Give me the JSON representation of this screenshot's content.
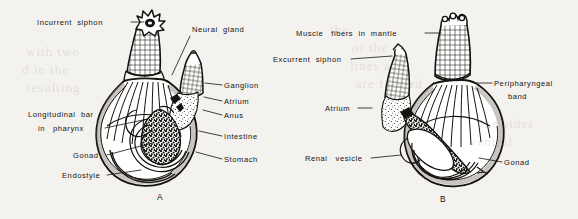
{
  "figure": {
    "background_color": "#f4f2ee",
    "ink_color": "#15130f",
    "width": 578,
    "height": 219,
    "panels": [
      {
        "id": "A",
        "caption": "A",
        "caption_x": 160,
        "caption_y": 200
      },
      {
        "id": "B",
        "caption": "B",
        "caption_x": 443,
        "caption_y": 202
      }
    ]
  },
  "labels_panel_a": [
    {
      "name": "incurrent-siphon",
      "text": "Incurrent  siphon",
      "x": 37,
      "y": 25,
      "anchor": "start",
      "leader": "M131,22 L144,22"
    },
    {
      "name": "neural-gland",
      "text": "Neural  gland",
      "x": 192,
      "y": 32,
      "anchor": "start",
      "leader": "M190,36 L172,75"
    },
    {
      "name": "ganglion",
      "text": "Ganglion",
      "x": 224,
      "y": 88,
      "anchor": "start",
      "leader": "M222,85 L205,83"
    },
    {
      "name": "atrium",
      "text": "Atrium",
      "x": 224,
      "y": 104,
      "anchor": "start",
      "leader": "M222,101 L204,97"
    },
    {
      "name": "anus",
      "text": "Anus",
      "x": 224,
      "y": 118,
      "anchor": "start",
      "leader": "M222,115 L203,110"
    },
    {
      "name": "intestine",
      "text": "Intestine",
      "x": 224,
      "y": 139,
      "anchor": "start",
      "leader": "M222,136 L199,131"
    },
    {
      "name": "stomach",
      "text": "Stomach",
      "x": 224,
      "y": 162,
      "anchor": "start",
      "leader": "M222,159 L196,152"
    },
    {
      "name": "longitudinal-bar-in-pharynx-line1",
      "text": "Longitudinal  bar",
      "x": 28,
      "y": 117,
      "anchor": "start",
      "leader": ""
    },
    {
      "name": "longitudinal-bar-in-pharynx-line2",
      "text": "in   pharynx",
      "x": 38,
      "y": 131,
      "anchor": "start",
      "leader": "M105,128 L148,119"
    },
    {
      "name": "gonad",
      "text": "Gonad",
      "x": 73,
      "y": 158,
      "anchor": "start",
      "leader": "M107,155 L152,143"
    },
    {
      "name": "endostyle",
      "text": "Endostyle",
      "x": 62,
      "y": 178,
      "anchor": "start",
      "leader": "M107,175 L141,170"
    }
  ],
  "labels_panel_b": [
    {
      "name": "muscle-fibers-in-mantle",
      "text": "Muscle   fibers  in  mantle",
      "x": 296,
      "y": 36,
      "anchor": "start",
      "leader": "M425,33 L441,33"
    },
    {
      "name": "excurrent-siphon",
      "text": "Excurrent  siphon",
      "x": 273,
      "y": 62,
      "anchor": "start",
      "leader": "M351,59 L392,56"
    },
    {
      "name": "peripharyngeal-band-line1",
      "text": "Peripharyngeal",
      "x": 494,
      "y": 86,
      "anchor": "start",
      "leader": "M492,83 L476,83"
    },
    {
      "name": "peripharyngeal-band-line2",
      "text": "band",
      "x": 508,
      "y": 99,
      "anchor": "start",
      "leader": ""
    },
    {
      "name": "atrium",
      "text": "Atrium",
      "x": 325,
      "y": 111,
      "anchor": "start",
      "leader": "M358,108 L372,108"
    },
    {
      "name": "renal-vesicle",
      "text": "Renal   vesicle",
      "x": 305,
      "y": 161,
      "anchor": "start",
      "leader": "M371,158 L401,155"
    },
    {
      "name": "gonad",
      "text": "Gonad",
      "x": 504,
      "y": 165,
      "anchor": "start",
      "leader": "M502,162 L479,158"
    }
  ],
  "bleed_through_text": [
    {
      "text": "with  two",
      "x": 26,
      "y": 44
    },
    {
      "text": "d  in  the",
      "x": 22,
      "y": 62
    },
    {
      "text": "resulting",
      "x": 26,
      "y": 80
    },
    {
      "text": "the",
      "x": 330,
      "y": 22
    },
    {
      "text": "of  the",
      "x": 352,
      "y": 40
    },
    {
      "text": "lines  and",
      "x": 350,
      "y": 58
    },
    {
      "text": "are  formed",
      "x": 356,
      "y": 76
    },
    {
      "text": "the  sides",
      "x": 480,
      "y": 116
    },
    {
      "text": "ventral",
      "x": 470,
      "y": 134
    }
  ]
}
